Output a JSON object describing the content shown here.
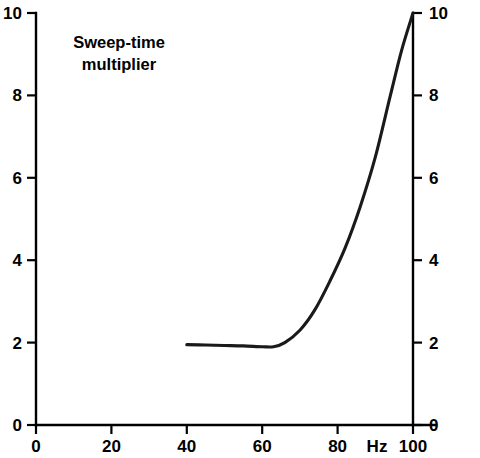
{
  "chart_data": {
    "type": "line",
    "title": "",
    "annotation": "Sweep-time multiplier",
    "annotation_line1": "Sweep-time",
    "annotation_line2": "multiplier",
    "xlabel": "Hz",
    "ylabel": "",
    "xlim": [
      0,
      100
    ],
    "ylim": [
      0,
      10
    ],
    "grid": false,
    "legend": null,
    "x_ticks": [
      0,
      20,
      40,
      60,
      80,
      100
    ],
    "x_tick_labels": [
      "0",
      "20",
      "40",
      "60",
      "80",
      "100"
    ],
    "y_ticks": [
      0,
      2,
      4,
      6,
      8,
      10
    ],
    "y_tick_labels": [
      "0",
      "2",
      "4",
      "6",
      "8",
      "10"
    ],
    "y_ticks_right": [
      0,
      2,
      4,
      6,
      8,
      10
    ],
    "y_tick_labels_right": [
      "0",
      "2",
      "4",
      "6",
      "8",
      "10"
    ],
    "series": [
      {
        "name": "Sweep-time multiplier",
        "color": "#1a1a1a",
        "x": [
          40,
          45,
          50,
          55,
          60,
          63,
          66,
          70,
          74,
          78,
          82,
          86,
          90,
          94,
          97,
          100
        ],
        "values": [
          1.95,
          1.94,
          1.93,
          1.92,
          1.9,
          1.9,
          2.0,
          2.3,
          2.8,
          3.5,
          4.3,
          5.3,
          6.5,
          8.0,
          9.1,
          10.0
        ]
      }
    ]
  },
  "axes": {
    "left_labels": [
      "10",
      "8",
      "6",
      "4",
      "2",
      "0"
    ],
    "right_labels": [
      "10",
      "8",
      "6",
      "4",
      "2",
      "0"
    ],
    "bottom_labels": [
      "0",
      "20",
      "40",
      "60",
      "80",
      "100"
    ],
    "unit_label": "Hz"
  }
}
